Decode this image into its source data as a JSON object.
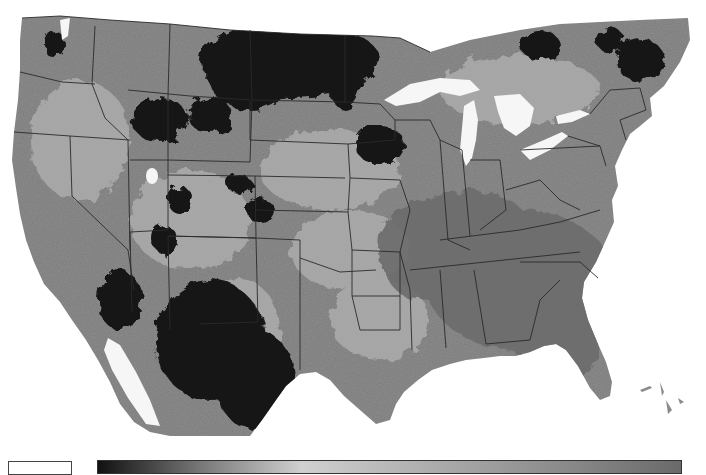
{
  "map": {
    "region": "Contiguous United States",
    "rendering": "grayscale raster with state boundaries",
    "colors": {
      "background": "#ffffff",
      "land_base": "#8c8c8c",
      "land_light": "#b4b4b4",
      "land_dark": "#1a1a1a",
      "southeast": "#6f6f6f",
      "water": "#ffffff",
      "state_border": "#2a2a2a"
    },
    "water_features": [
      "Lake Superior",
      "Lake Michigan",
      "Lake Huron",
      "Lake Erie",
      "Lake Ontario",
      "Great Salt Lake",
      "Gulf of California"
    ]
  },
  "legend": {
    "no_data_swatch": {
      "color": "#ffffff",
      "label": ""
    },
    "colorbar": {
      "stops": [
        {
          "offset": "0%",
          "color": "#111111"
        },
        {
          "offset": "18%",
          "color": "#7a7a7a"
        },
        {
          "offset": "35%",
          "color": "#d0d0d0"
        },
        {
          "offset": "55%",
          "color": "#b0b0b0"
        },
        {
          "offset": "80%",
          "color": "#8a8a8a"
        },
        {
          "offset": "100%",
          "color": "#6a6a6a"
        }
      ],
      "min_label": "",
      "max_label": ""
    }
  }
}
